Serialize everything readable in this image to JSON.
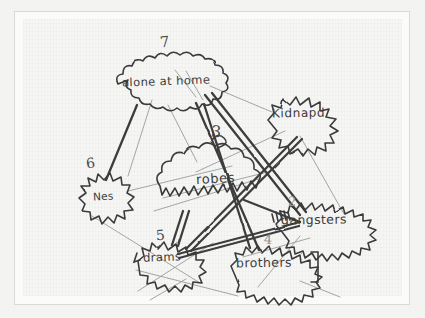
{
  "image": {
    "kind": "photograph-of-handdrawn-concept-map",
    "media": "pencil and ballpoint on paper",
    "paper_color": "#f6f6f5",
    "ink_color": "#3b3b3b",
    "faint_ink_color": "#8d8d8d",
    "mount_color": "#fbfbfa",
    "backdrop_color": "#f3f3f2"
  },
  "diagram": {
    "title": "",
    "nodes": [
      {
        "id": "alone-at-home",
        "label": "alone at home",
        "number": "7",
        "shape": "cloud",
        "cx": 172,
        "cy": 88,
        "rx": 55,
        "ry": 25,
        "text_x": 122,
        "text_y": 81,
        "font_size": 11.5,
        "num_x": 160,
        "num_y": 40,
        "num_size": 15
      },
      {
        "id": "kidnapd",
        "label": "Kidnapd",
        "number": "",
        "shape": "cloud",
        "cx": 308,
        "cy": 119,
        "rx": 40,
        "ry": 20,
        "text_x": 272,
        "text_y": 113,
        "font_size": 12,
        "num_x": 0,
        "num_y": 0,
        "num_size": 0
      },
      {
        "id": "robes",
        "label": "robes",
        "number": "3",
        "shape": "cloud-spiky-bottom",
        "cx": 210,
        "cy": 183,
        "rx": 53,
        "ry": 30,
        "text_x": 196,
        "text_y": 179,
        "font_size": 13,
        "num_x": 213,
        "num_y": 128,
        "num_size": 16
      },
      {
        "id": "nes",
        "label": "Nes",
        "number": "6",
        "shape": "cloud",
        "cx": 106,
        "cy": 200,
        "rx": 28,
        "ry": 21,
        "text_x": 94,
        "text_y": 196,
        "font_size": 10.5,
        "num_x": 87,
        "num_y": 161,
        "num_size": 14
      },
      {
        "id": "gangsters",
        "label": "gangsters",
        "number": "2",
        "shape": "cloud",
        "cx": 325,
        "cy": 224,
        "rx": 48,
        "ry": 21,
        "text_x": 281,
        "text_y": 219,
        "font_size": 12.5,
        "num_x": 289,
        "num_y": 200,
        "num_size": 14
      },
      {
        "id": "drams",
        "label": "drams",
        "number": "5",
        "shape": "cloud",
        "cx": 169,
        "cy": 260,
        "rx": 32,
        "ry": 17,
        "text_x": 143,
        "text_y": 256,
        "font_size": 11.5,
        "num_x": 157,
        "num_y": 233,
        "num_size": 14
      },
      {
        "id": "brothers",
        "label": "brothers",
        "number": "4",
        "shape": "cloud",
        "cx": 272,
        "cy": 265,
        "rx": 42,
        "ry": 17,
        "text_x": 235,
        "text_y": 261,
        "font_size": 12.5,
        "num_x": 265,
        "num_y": 238,
        "num_size": 14
      }
    ],
    "edges": [
      {
        "from": "alone-at-home",
        "to": "nes",
        "weight": "heavy"
      },
      {
        "from": "alone-at-home",
        "to": "robes",
        "weight": "light"
      },
      {
        "from": "alone-at-home",
        "to": "gangsters",
        "weight": "heavy"
      },
      {
        "from": "alone-at-home",
        "to": "brothers",
        "weight": "heavy"
      },
      {
        "from": "alone-at-home",
        "to": "kidnapd",
        "weight": "light"
      },
      {
        "from": "kidnapd",
        "to": "drams",
        "weight": "heavy"
      },
      {
        "from": "kidnapd",
        "to": "robes",
        "weight": "light"
      },
      {
        "from": "robes",
        "to": "gangsters",
        "weight": "heavy"
      },
      {
        "from": "robes",
        "to": "drams",
        "weight": "heavy"
      },
      {
        "from": "drams",
        "to": "gangsters",
        "weight": "heavy"
      },
      {
        "from": "nes",
        "to": "robes",
        "weight": "light"
      },
      {
        "from": "brothers",
        "to": "gangsters",
        "weight": "light"
      },
      {
        "from": "nes",
        "to": "drams",
        "weight": "light"
      }
    ]
  }
}
